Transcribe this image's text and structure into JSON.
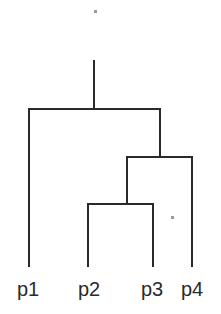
{
  "diagram": {
    "type": "dendrogram",
    "line_color": "#2a2a2a",
    "leaves": [
      {
        "label": "p1",
        "x": 29,
        "lx": 17
      },
      {
        "label": "p2",
        "x": 88,
        "lx": 78
      },
      {
        "label": "p3",
        "x": 153,
        "lx": 141
      },
      {
        "label": "p4",
        "x": 192,
        "lx": 181
      }
    ],
    "leaf_bottom_y": 266,
    "merges": [
      {
        "children": [
          "p2",
          "p3"
        ],
        "y": 204,
        "left_x": 88,
        "right_x": 153,
        "mid_x": 127
      },
      {
        "children": [
          "(p2,p3)",
          "p4"
        ],
        "y": 157,
        "left_x": 127,
        "right_x": 192,
        "mid_x": 160
      },
      {
        "children": [
          "p1",
          "((p2,p3),p4)"
        ],
        "y": 109,
        "left_x": 29,
        "right_x": 160,
        "mid_x": 94
      }
    ],
    "root_stem_top_y": 61,
    "artifacts": [
      {
        "x": 94,
        "y": 10
      },
      {
        "x": 171,
        "y": 216
      }
    ]
  }
}
